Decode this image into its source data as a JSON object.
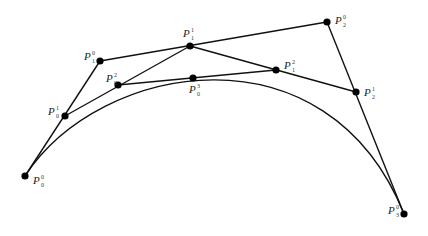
{
  "diagram": {
    "type": "de-casteljau-bezier-construction",
    "points": [
      {
        "id": "P00",
        "name": "P",
        "sup": "0",
        "sub": "0",
        "x": 25,
        "y": 176,
        "lx": 33,
        "ly": 184
      },
      {
        "id": "P10",
        "name": "P",
        "sup": "0",
        "sub": "1",
        "x": 100,
        "y": 61,
        "lx": 84,
        "ly": 60
      },
      {
        "id": "P20",
        "name": "P",
        "sup": "0",
        "sub": "2",
        "x": 327,
        "y": 22,
        "lx": 335,
        "ly": 24
      },
      {
        "id": "P30",
        "name": "P",
        "sup": "0",
        "sub": "3",
        "x": 404,
        "y": 214,
        "lx": 388,
        "ly": 214
      },
      {
        "id": "P01",
        "name": "P",
        "sup": "1",
        "sub": "0",
        "x": 65,
        "y": 116,
        "lx": 48,
        "ly": 115
      },
      {
        "id": "P11",
        "name": "P",
        "sup": "1",
        "sub": "1",
        "x": 190,
        "y": 46,
        "lx": 183,
        "ly": 37
      },
      {
        "id": "P21",
        "name": "P",
        "sup": "1",
        "sub": "2",
        "x": 356,
        "y": 92,
        "lx": 364,
        "ly": 96
      },
      {
        "id": "P02",
        "name": "P",
        "sup": "2",
        "sub": "0",
        "x": 118,
        "y": 85,
        "lx": 106,
        "ly": 82
      },
      {
        "id": "P12",
        "name": "P",
        "sup": "2",
        "sub": "1",
        "x": 276,
        "y": 70,
        "lx": 284,
        "ly": 69
      },
      {
        "id": "P03",
        "name": "P",
        "sup": "3",
        "sub": "0",
        "x": 193,
        "y": 78,
        "lx": 189,
        "ly": 93
      }
    ],
    "segments": [
      [
        "P00",
        "P10"
      ],
      [
        "P10",
        "P20"
      ],
      [
        "P20",
        "P30"
      ],
      [
        "P01",
        "P11"
      ],
      [
        "P11",
        "P21"
      ],
      [
        "P02",
        "P12"
      ]
    ],
    "curves": [
      {
        "from": "P00",
        "via": "P03",
        "to": "P30"
      }
    ]
  }
}
